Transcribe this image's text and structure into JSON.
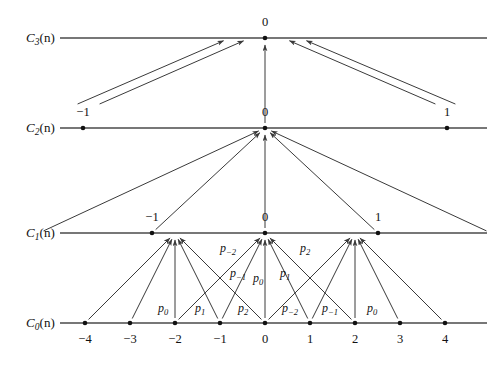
{
  "figure": {
    "background_color": "#ffffff",
    "line_color": "#4a4a4a",
    "arrow_color": "#3a3a3a",
    "node_color": "#111111",
    "width": 493,
    "height": 368
  },
  "rows": [
    {
      "id": "c3",
      "label_main": "C",
      "label_sub": "3",
      "label_arg": "(n)",
      "label_text": "C3(n)",
      "y": 38,
      "line_x1": 60,
      "line_x2": 487
    },
    {
      "id": "c2",
      "label_main": "C",
      "label_sub": "2",
      "label_arg": "(n)",
      "label_text": "C2(n)",
      "y": 128,
      "line_x1": 60,
      "line_x2": 487
    },
    {
      "id": "c1",
      "label_main": "C",
      "label_sub": "1",
      "label_arg": "(n)",
      "label_text": "C1(n)",
      "y": 233,
      "line_x1": 60,
      "line_x2": 487
    },
    {
      "id": "c0",
      "label_main": "C",
      "label_sub": "0",
      "label_arg": "(n)",
      "label_text": "C0(n)",
      "y": 323,
      "line_x1": 60,
      "line_x2": 487
    }
  ],
  "nodes": {
    "c3": [
      {
        "label": "0",
        "x": 265
      }
    ],
    "c2": [
      {
        "label": "−1",
        "x": 83
      },
      {
        "label": "0",
        "x": 265
      },
      {
        "label": "1",
        "x": 447
      }
    ],
    "c1": [
      {
        "label": "−2",
        "x": 39
      },
      {
        "label": "−1",
        "x": 152
      },
      {
        "label": "0",
        "x": 265
      },
      {
        "label": "1",
        "x": 378
      },
      {
        "label": "2",
        "x": 491
      }
    ],
    "c0": [
      {
        "label": "−4",
        "x": 85
      },
      {
        "label": "−3",
        "x": 130
      },
      {
        "label": "−2",
        "x": 175
      },
      {
        "label": "−1",
        "x": 220
      },
      {
        "label": "0",
        "x": 265
      },
      {
        "label": "1",
        "x": 310
      },
      {
        "label": "2",
        "x": 355
      },
      {
        "label": "3",
        "x": 400
      },
      {
        "label": "4",
        "x": 445
      }
    ]
  },
  "p_labels_upper": [
    {
      "text": "p",
      "sub": "−2",
      "x": 228,
      "y": 248
    },
    {
      "text": "p",
      "sub": "−1",
      "x": 238,
      "y": 273
    },
    {
      "text": "p",
      "sub": "0",
      "x": 258,
      "y": 278
    },
    {
      "text": "p",
      "sub": "1",
      "x": 285,
      "y": 273
    },
    {
      "text": "p",
      "sub": "2",
      "x": 305,
      "y": 248
    }
  ],
  "p_labels_lower": [
    {
      "text": "p",
      "sub": "0",
      "x": 163,
      "y": 308
    },
    {
      "text": "p",
      "sub": "1",
      "x": 200,
      "y": 308
    },
    {
      "text": "p",
      "sub": "2",
      "x": 243,
      "y": 308
    },
    {
      "text": "p",
      "sub": "−2",
      "x": 290,
      "y": 308
    },
    {
      "text": "p",
      "sub": "−1",
      "x": 330,
      "y": 308
    },
    {
      "text": "p",
      "sub": "0",
      "x": 372,
      "y": 308
    }
  ],
  "arrows_c0_to_c1": [
    {
      "from_x": 85,
      "to_x": 175,
      "target": "−2"
    },
    {
      "from_x": 130,
      "to_x": 175,
      "target": "−2"
    },
    {
      "from_x": 175,
      "to_x": 175,
      "target": "−2"
    },
    {
      "from_x": 220,
      "to_x": 175,
      "target": "−2"
    },
    {
      "from_x": 265,
      "to_x": 175,
      "target": "−2"
    },
    {
      "from_x": 175,
      "to_x": 265,
      "target": "0"
    },
    {
      "from_x": 220,
      "to_x": 265,
      "target": "0"
    },
    {
      "from_x": 265,
      "to_x": 265,
      "target": "0"
    },
    {
      "from_x": 310,
      "to_x": 265,
      "target": "0"
    },
    {
      "from_x": 355,
      "to_x": 265,
      "target": "0"
    },
    {
      "from_x": 265,
      "to_x": 355,
      "target": "2"
    },
    {
      "from_x": 310,
      "to_x": 355,
      "target": "2"
    },
    {
      "from_x": 355,
      "to_x": 355,
      "target": "2"
    },
    {
      "from_x": 400,
      "to_x": 355,
      "target": "2"
    },
    {
      "from_x": 445,
      "to_x": 355,
      "target": "2"
    }
  ],
  "arrows_c1_to_c2": [
    {
      "from_x": 39,
      "to_x": 265
    },
    {
      "from_x": 152,
      "to_x": 265
    },
    {
      "from_x": 265,
      "to_x": 265
    },
    {
      "from_x": 378,
      "to_x": 265
    },
    {
      "from_x": 491,
      "to_x": 265
    }
  ],
  "arrows_c2_to_c3": [
    {
      "from_x": 73,
      "to_x": 230
    },
    {
      "from_x": 95,
      "to_x": 250
    },
    {
      "from_x": 265,
      "to_x": 265
    },
    {
      "from_x": 440,
      "to_x": 283
    },
    {
      "from_x": 460,
      "to_x": 300
    }
  ]
}
